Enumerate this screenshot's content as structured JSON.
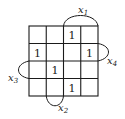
{
  "kmap": {
    "rows": 4,
    "cols": 4,
    "cells": [
      [
        "",
        "",
        "1",
        ""
      ],
      [
        "1",
        "",
        "",
        "1"
      ],
      [
        "",
        "1",
        "",
        ""
      ],
      [
        "",
        "",
        "1",
        ""
      ]
    ],
    "variables": {
      "top": {
        "name": "x",
        "sub": "1",
        "span": "cols 3-4"
      },
      "right": {
        "name": "x",
        "sub": "4",
        "span": "rows 2-3"
      },
      "left": {
        "name": "x",
        "sub": "3",
        "span": "rows 3-4"
      },
      "bottom": {
        "name": "x",
        "sub": "2",
        "span": "cols 2-3"
      }
    }
  },
  "colors": {
    "line": "#1a1a1a",
    "background": "#ffffff"
  }
}
